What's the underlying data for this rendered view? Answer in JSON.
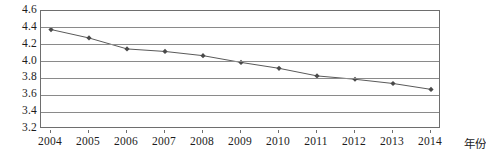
{
  "chart_data": {
    "type": "line",
    "title": "",
    "xlabel": "年份",
    "ylabel": "",
    "categories": [
      "2004",
      "2005",
      "2006",
      "2007",
      "2008",
      "2009",
      "2010",
      "2011",
      "2012",
      "2013",
      "2014"
    ],
    "series": [
      {
        "name": "",
        "values": [
          4.38,
          4.28,
          4.15,
          4.12,
          4.07,
          3.99,
          3.92,
          3.83,
          3.79,
          3.74,
          3.67
        ]
      }
    ],
    "ylim": [
      3.2,
      4.6
    ],
    "ytick_labels": [
      "4.6",
      "4.4",
      "4.2",
      "4.0",
      "3.8",
      "3.6",
      "3.4",
      "3.2"
    ],
    "ytick_values": [
      4.6,
      4.4,
      4.2,
      4.0,
      3.8,
      3.6,
      3.4,
      3.2
    ],
    "grid": true,
    "legend": "none",
    "marker": "diamond",
    "colors": {
      "line": "#5a5a5a",
      "marker": "#4a4a4a",
      "gridline": "#8a8a8a",
      "frame": "#6e6e6e",
      "text": "#1c1c1c",
      "background": "#ffffff"
    }
  }
}
